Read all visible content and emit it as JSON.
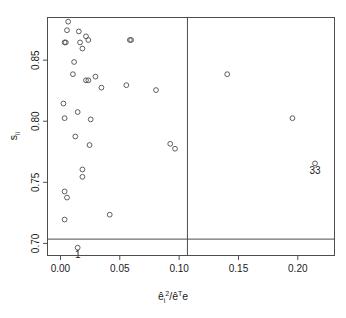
{
  "chart_data": {
    "type": "scatter",
    "title": "",
    "subtitle": "",
    "xlabel": "êi2/êTe",
    "xlabel_parts": {
      "base1": "ê",
      "sub1": "i",
      "sup1": "2",
      "slash": "/",
      "base2": "ê",
      "sup2": "T",
      "base3": "e"
    },
    "ylabel": "sii",
    "ylabel_parts": {
      "base": "s",
      "sub": "ii"
    },
    "xlim": [
      -0.0105,
      0.2305
    ],
    "ylim": [
      0.6905,
      0.8845
    ],
    "xticks": [
      0.0,
      0.05,
      0.1,
      0.15,
      0.2
    ],
    "xticklabels": [
      "0.00",
      "0.05",
      "0.10",
      "0.15",
      "0.20"
    ],
    "yticks": [
      0.7,
      0.75,
      0.8,
      0.85
    ],
    "yticklabels": [
      "0.70",
      "0.75",
      "0.80",
      "0.85"
    ],
    "grid": false,
    "legend": null,
    "marker": "open-circle",
    "marker_color": "#4d4d4d",
    "box_color": "#4d4d4d",
    "reference_lines": [
      {
        "orientation": "vertical",
        "value": 0.107,
        "name": "vline-cutoff"
      },
      {
        "orientation": "horizontal",
        "value": 0.7035,
        "name": "hline-cutoff"
      }
    ],
    "points": [
      {
        "x": 0.0065,
        "y": 0.8815
      },
      {
        "x": 0.0055,
        "y": 0.8745
      },
      {
        "x": 0.0155,
        "y": 0.8735
      },
      {
        "x": 0.0215,
        "y": 0.8695
      },
      {
        "x": 0.0235,
        "y": 0.8665
      },
      {
        "x": 0.0035,
        "y": 0.8645
      },
      {
        "x": 0.0045,
        "y": 0.8645
      },
      {
        "x": 0.0165,
        "y": 0.8645
      },
      {
        "x": 0.0185,
        "y": 0.8595
      },
      {
        "x": 0.0585,
        "y": 0.8665
      },
      {
        "x": 0.0595,
        "y": 0.8665
      },
      {
        "x": 0.0115,
        "y": 0.8485
      },
      {
        "x": 0.0105,
        "y": 0.8385
      },
      {
        "x": 0.0215,
        "y": 0.8335
      },
      {
        "x": 0.0235,
        "y": 0.8335
      },
      {
        "x": 0.0295,
        "y": 0.8365
      },
      {
        "x": 0.0345,
        "y": 0.8275
      },
      {
        "x": 0.0555,
        "y": 0.8295
      },
      {
        "x": 0.0805,
        "y": 0.8255
      },
      {
        "x": 0.1405,
        "y": 0.8385
      },
      {
        "x": 0.0025,
        "y": 0.8145
      },
      {
        "x": 0.0035,
        "y": 0.8025
      },
      {
        "x": 0.0145,
        "y": 0.8075
      },
      {
        "x": 0.0255,
        "y": 0.8015
      },
      {
        "x": 0.1955,
        "y": 0.8025
      },
      {
        "x": 0.0125,
        "y": 0.7875
      },
      {
        "x": 0.0245,
        "y": 0.7805
      },
      {
        "x": 0.0925,
        "y": 0.7815
      },
      {
        "x": 0.0965,
        "y": 0.7775
      },
      {
        "x": 0.0185,
        "y": 0.7605
      },
      {
        "x": 0.0185,
        "y": 0.7545
      },
      {
        "x": 0.0035,
        "y": 0.7425
      },
      {
        "x": 0.0055,
        "y": 0.7375
      },
      {
        "x": 0.0035,
        "y": 0.7195
      },
      {
        "x": 0.0415,
        "y": 0.7235
      },
      {
        "x": 0.0145,
        "y": 0.6965
      },
      {
        "x": 0.2145,
        "y": 0.7655
      }
    ],
    "annotations": [
      {
        "label": "1",
        "x": 0.0145,
        "y": 0.6965,
        "dx": 0,
        "dy": 10,
        "name": "point-label-1"
      },
      {
        "label": "33",
        "x": 0.2145,
        "y": 0.7655,
        "dx": 0,
        "dy": 11,
        "name": "point-label-33"
      }
    ]
  }
}
